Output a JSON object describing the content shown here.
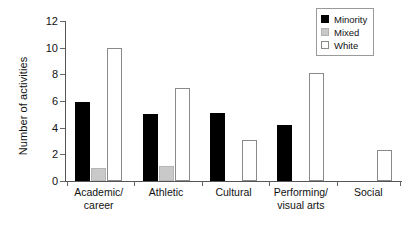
{
  "chart_data": {
    "type": "bar",
    "title": "",
    "subtitle": "",
    "xlabel": "",
    "ylabel": "Number of activities",
    "ylim": [
      0,
      12
    ],
    "yticks": [
      0,
      2,
      4,
      6,
      8,
      10,
      12
    ],
    "ytick_labels": [
      "0",
      "2",
      "4",
      "6",
      "8",
      "10",
      "12"
    ],
    "grid": false,
    "legend_position": "top-right",
    "categories": [
      "Academic/ career",
      "Athletic",
      "Cultural",
      "Performing/ visual arts",
      "Social"
    ],
    "category_lines": [
      [
        "Academic/",
        "career"
      ],
      [
        "Athletic"
      ],
      [
        "Cultural"
      ],
      [
        "Performing/",
        "visual arts"
      ],
      [
        "Social"
      ]
    ],
    "series": [
      {
        "name": "Minority",
        "color": "#000000",
        "values": [
          5.9,
          5.0,
          5.1,
          4.2,
          0
        ]
      },
      {
        "name": "Mixed",
        "color": "#c9c9c9",
        "values": [
          1.0,
          1.1,
          0,
          0,
          0
        ]
      },
      {
        "name": "White",
        "color": "#ffffff",
        "values": [
          10.0,
          7.0,
          3.1,
          8.1,
          2.3
        ]
      }
    ]
  },
  "legend": {
    "items": [
      {
        "label": "Minority",
        "swatch": "minority"
      },
      {
        "label": "Mixed",
        "swatch": "mixed"
      },
      {
        "label": "White",
        "swatch": "white"
      }
    ]
  },
  "axes": {
    "y_title": "Number of activities"
  }
}
